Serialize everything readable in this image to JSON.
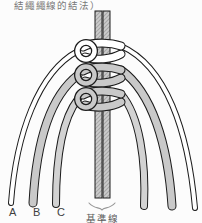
{
  "figure": {
    "caption_top": "結繩繩線的結法）",
    "cord_labels": [
      "A",
      "B",
      "C"
    ],
    "baseline_label": "基準線"
  },
  "icons": {
    "underbrace": "curly-underbrace-icon"
  },
  "colors": {
    "background": "#fcfcfc",
    "cord_outline": "#1c1c1c",
    "cord_white": "#ffffff",
    "cord_gray": "#c9c9c9",
    "cord_gray_light": "#d2d2d2",
    "center_cord_fill": "#cccccc",
    "center_cord_hatch": "#a6a6a6",
    "caption_text": "#787878",
    "label_text": "#3f3f3f",
    "baseline_text": "#5a5a5a",
    "brace": "#979797"
  }
}
